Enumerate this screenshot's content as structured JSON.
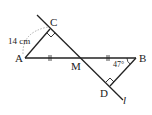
{
  "diagram": {
    "points": {
      "A": {
        "label": "A",
        "x": 25,
        "y": 58
      },
      "B": {
        "label": "B",
        "x": 136,
        "y": 58
      },
      "C": {
        "label": "C",
        "x": 50,
        "y": 29
      },
      "D": {
        "label": "D",
        "x": 110,
        "y": 86
      },
      "M": {
        "label": "M",
        "x": 81,
        "y": 58
      }
    },
    "line_label": "l",
    "length_label": "14 cm",
    "angle_label": "47°",
    "colors": {
      "stroke": "#222222",
      "dashed": "#999999"
    }
  }
}
